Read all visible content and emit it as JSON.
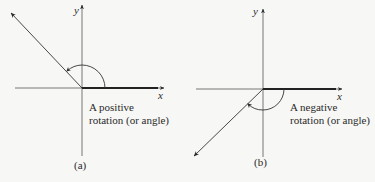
{
  "figure": {
    "colors": {
      "ink": "#2a2a2a",
      "background": "#f7f7f5"
    },
    "panels": [
      {
        "id": "a",
        "panel_label": "(a)",
        "x_axis_label": "x",
        "y_axis_label": "y",
        "caption_line1": "A positive",
        "caption_line2": "rotation (or angle)",
        "rotation_direction": "counterclockwise",
        "terminal_side_quadrant": "II"
      },
      {
        "id": "b",
        "panel_label": "(b)",
        "x_axis_label": "x",
        "y_axis_label": "y",
        "caption_line1": "A negative",
        "caption_line2": "rotation (or angle)",
        "rotation_direction": "clockwise",
        "terminal_side_quadrant": "III"
      }
    ]
  }
}
